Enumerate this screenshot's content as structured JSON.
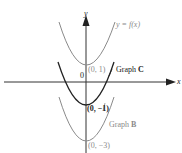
{
  "diagram": {
    "axes": {
      "x_label": "x",
      "y_label": "y",
      "origin_label": "0"
    },
    "curves": [
      {
        "name": "y = f(x)",
        "label": "y = f(x)",
        "vertex_label": "(0, 1)",
        "vertex": [
          0,
          1
        ],
        "color": "#8a8a8a"
      },
      {
        "name": "Graph C",
        "label_prefix": "Graph ",
        "label_bold": "C",
        "vertex_label": "(0, −1)",
        "vertex": [
          0,
          -1
        ],
        "color": "#222222"
      },
      {
        "name": "Graph B",
        "label_prefix": "Graph ",
        "label_bold": "B",
        "vertex_label": "(0, −3)",
        "vertex": [
          0,
          -3
        ],
        "color": "#8a8a8a"
      }
    ]
  }
}
